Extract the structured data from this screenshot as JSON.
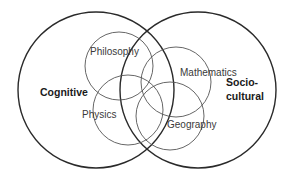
{
  "diagram": {
    "big_sets": [
      {
        "id": "cognitive",
        "label_lines": [
          "Cognitive"
        ]
      },
      {
        "id": "socio-cultural",
        "label_lines": [
          "Socio-",
          "cultural"
        ]
      }
    ],
    "subject_sets": [
      {
        "id": "philosophy",
        "label": "Philosophy"
      },
      {
        "id": "mathematics",
        "label": "Mathematics"
      },
      {
        "id": "physics",
        "label": "Physics"
      },
      {
        "id": "geography",
        "label": "Geography"
      }
    ],
    "colors": {
      "big_stroke": "#2a2a2a",
      "small_stroke": "#555555",
      "background": "#ffffff"
    }
  }
}
